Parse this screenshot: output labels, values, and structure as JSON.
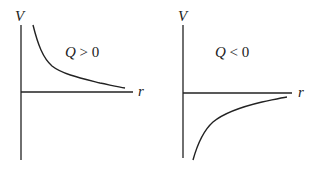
{
  "figure": {
    "left_plot": {
      "y_axis_label": "V",
      "x_axis_label": "r",
      "condition_var": "Q",
      "condition_rest": " > 0",
      "description": "Potential positive, decays toward zero as r increases"
    },
    "right_plot": {
      "y_axis_label": "V",
      "x_axis_label": "r",
      "condition_var": "Q",
      "condition_rest": " < 0",
      "description": "Potential negative, rises toward zero as r increases"
    },
    "stroke_color": "#222222"
  }
}
